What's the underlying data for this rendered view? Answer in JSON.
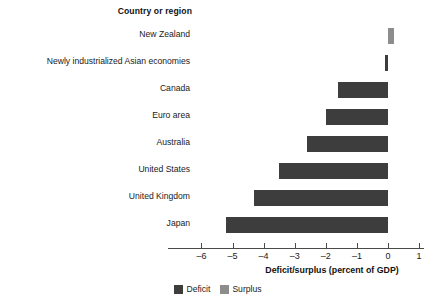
{
  "header": {
    "column_title": "Country or region",
    "clipped_fragment": "p"
  },
  "axis": {
    "title": "Deficit/surplus (percent of GDP)",
    "ticks": [
      "–6",
      "–5",
      "–4",
      "–3",
      "–2",
      "–1",
      "0",
      "1"
    ]
  },
  "legend": {
    "items": [
      {
        "label": "Deficit",
        "color": "#3d3d3d"
      },
      {
        "label": "Surplus",
        "color": "#8d8d8d"
      }
    ]
  },
  "colors": {
    "deficit": "#3d3d3d",
    "surplus": "#8d8d8d",
    "axis": "#4a4a4a",
    "text": "#1a1a1a",
    "background": "#ffffff"
  },
  "chart_data": {
    "type": "bar",
    "orientation": "horizontal",
    "title": "",
    "xlabel": "Deficit/surplus (percent of GDP)",
    "ylabel": "Country or region",
    "xlim": [
      -6,
      1
    ],
    "xticks": [
      -6,
      -5,
      -4,
      -3,
      -2,
      -1,
      0,
      1
    ],
    "grid": false,
    "legend_position": "bottom-center",
    "categories": [
      "New Zealand",
      "Newly industrialized Asian economies",
      "Canada",
      "Euro area",
      "Australia",
      "United States",
      "United Kingdom",
      "Japan"
    ],
    "values": [
      0.2,
      -0.1,
      -1.6,
      -2.0,
      -2.6,
      -3.5,
      -4.3,
      -5.2
    ],
    "series": [
      {
        "name": "Deficit",
        "color": "#3d3d3d",
        "values": [
          null,
          -0.1,
          -1.6,
          -2.0,
          -2.6,
          -3.5,
          -4.3,
          -5.2
        ]
      },
      {
        "name": "Surplus",
        "color": "#8d8d8d",
        "values": [
          0.2,
          null,
          null,
          null,
          null,
          null,
          null,
          null
        ]
      }
    ]
  }
}
